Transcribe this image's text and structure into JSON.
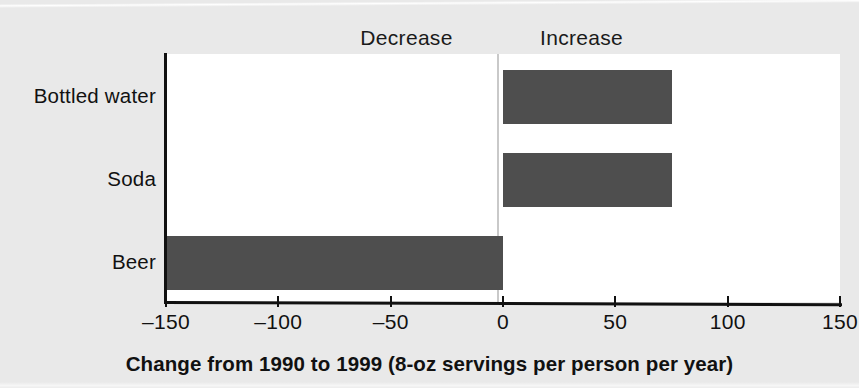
{
  "chart_data": {
    "type": "bar",
    "orientation": "horizontal",
    "title": "",
    "xlabel": "Change from 1990 to 1999 (8-oz servings per person per year)",
    "ylabel": "",
    "categories": [
      "Bottled water",
      "Soda",
      "Beer"
    ],
    "values": [
      75,
      75,
      -150
    ],
    "series": [
      {
        "name": "Change 1990-1999",
        "values": [
          75,
          75,
          -150
        ]
      }
    ],
    "xlim": [
      -150,
      150
    ],
    "xticks": [
      -150,
      -100,
      -50,
      0,
      50,
      100,
      150
    ],
    "xtick_labels": [
      "–150",
      "–100",
      "–50",
      "0",
      "50",
      "100",
      "150"
    ],
    "grid": false,
    "legend": false,
    "annotations": [
      {
        "text": "Decrease",
        "position": "above-left-of-zero"
      },
      {
        "text": "Increase",
        "position": "above-right-of-zero"
      }
    ],
    "bar_color": "#4e4e4e",
    "plot_background": "#ffffff",
    "figure_background": "#e9e9e9",
    "axis_color": "#111111"
  },
  "labels": {
    "decrease": "Decrease",
    "increase": "Increase"
  }
}
